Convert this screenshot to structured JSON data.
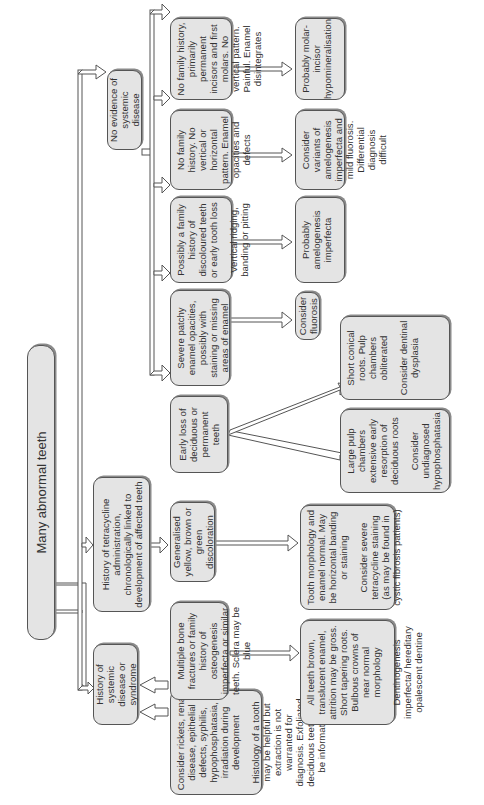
{
  "title": "Many abnormal teeth",
  "level1": {
    "systemic": "History of systemic disease or syndrome",
    "tetracycline": "History of tetracycline administration, chronologically linked to development of affected teeth",
    "no_systemic": "No evidence of systemic disease"
  },
  "systemic_branch": {
    "consider_rickets": [
      "Consider rickets, renal disease, epithelial defects, syphilis, hypophosphatasia, irradiation during development",
      "Histology of a tooth may be helpful but extraction is not warranted for diagnosis. Exfoliated deciduous teeth may be informative"
    ],
    "bone_fractures": "Multiple bone fractures or family history of osteogenesis imperfecta or similar teeth. Sclera may be blue",
    "teeth_brown": [
      "All teeth brown, translucent enamel, attrition may be gross. Short tapering roots. Bulbous crowns of near normal morphology",
      "Dentinogenesis imperfecta/ hereditary opalescent dentine"
    ]
  },
  "tetracycline_branch": {
    "discoloration": "Generalised yellow, brown or green discoloration",
    "morphology": [
      "Tooth morphology and enamel normal. May be horizontal banding or staining",
      "Consider severe tetracycline staining (as may be found in cystic fibrosis patients)"
    ]
  },
  "no_systemic_branch": {
    "early_loss": "Early loss of deciduous or permanent teeth",
    "large_pulp": [
      "Large pulp chambers extensive early resorption of deciduous roots",
      "Consider undiagnosed hypophosphatasia"
    ],
    "short_roots": [
      "Short conical roots. Pulp chambers obliterated",
      "Consider dentinal dysplasia"
    ],
    "severe_patchy": "Severe patchy enamel opacities, possibly with staining or missing areas of enamel",
    "fluorosis": "Consider fluorosis",
    "family_history": [
      "Possibly a family history of discoloured teeth or early tooth loss",
      "Vertical ridging, banding or pitting"
    ],
    "amelogenesis": "Probably amelogenesis imperfecta",
    "no_family_horizontal": "No family history. No vertical or horizontal pattern. Enamel opacities and defects",
    "variants": "Consider variants of amelogenesis imperfecta and mild fluorosis. Differential diagnosis difficult",
    "no_family_molars": "No family history, primarily permanent incisors and first molars. No vertical pattern. Painful. Enamel disintegrates",
    "mih": "Probably molar-incisor hypomineralisation"
  },
  "colors": {
    "box_fill": "#e4e4e4",
    "box_border": "#555555",
    "text": "#333333",
    "background": "#ffffff"
  }
}
